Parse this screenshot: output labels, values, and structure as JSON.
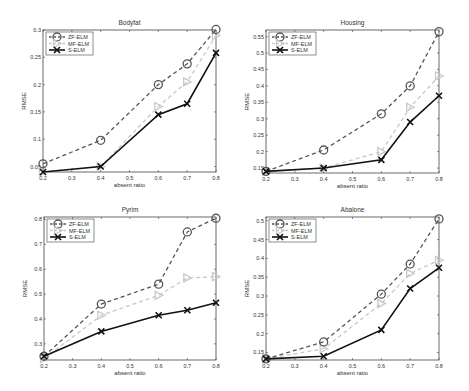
{
  "chart_data": [
    {
      "type": "line",
      "title": "Bodyfat",
      "xlabel": "absent ratio",
      "ylabel": "RMSE",
      "x": [
        0.2,
        0.4,
        0.6,
        0.7,
        0.8
      ],
      "xticks": [
        "0.2",
        "0.3",
        "0.4",
        "0.5",
        "0.6",
        "0.7",
        "0.8"
      ],
      "yticks": [
        "0.05",
        "0.1",
        "0.15",
        "0.2",
        "0.25",
        "0.3"
      ],
      "ylim": [
        0.04,
        0.3
      ],
      "xlim": [
        0.2,
        0.8
      ],
      "legend_position": "upper left",
      "grid": false,
      "series": [
        {
          "name": "ZF-ELM",
          "values": [
            0.055,
            0.098,
            0.2,
            0.238,
            0.301
          ]
        },
        {
          "name": "MF-ELM",
          "values": [
            0.04,
            0.05,
            0.16,
            0.205,
            0.29
          ]
        },
        {
          "name": "S-ELM",
          "values": [
            0.04,
            0.05,
            0.145,
            0.165,
            0.258
          ]
        }
      ]
    },
    {
      "type": "line",
      "title": "Housing",
      "xlabel": "absent ratio",
      "ylabel": "RMSE",
      "x": [
        0.2,
        0.4,
        0.6,
        0.7,
        0.8
      ],
      "xticks": [
        "0.2",
        "0.3",
        "0.4",
        "0.5",
        "0.6",
        "0.7",
        "0.8"
      ],
      "yticks": [
        "0.15",
        "0.2",
        "0.25",
        "0.3",
        "0.35",
        "0.4",
        "0.45",
        "0.5",
        "0.55"
      ],
      "ylim": [
        0.135,
        0.57
      ],
      "xlim": [
        0.2,
        0.8
      ],
      "legend_position": "upper left",
      "grid": false,
      "series": [
        {
          "name": "ZF-ELM",
          "values": [
            0.14,
            0.205,
            0.315,
            0.4,
            0.565
          ]
        },
        {
          "name": "MF-ELM",
          "values": [
            0.14,
            0.15,
            0.2,
            0.335,
            0.43
          ]
        },
        {
          "name": "S-ELM",
          "values": [
            0.14,
            0.15,
            0.175,
            0.29,
            0.37
          ]
        }
      ]
    },
    {
      "type": "line",
      "title": "Pyrim",
      "xlabel": "absent ratio",
      "ylabel": "RMSE",
      "x": [
        0.2,
        0.4,
        0.6,
        0.7,
        0.8
      ],
      "xticks": [
        "0.2",
        "0.3",
        "0.4",
        "0.5",
        "0.6",
        "0.7",
        "0.8"
      ],
      "yticks": [
        "0.3",
        "0.4",
        "0.5",
        "0.6",
        "0.7",
        "0.8"
      ],
      "ylim": [
        0.235,
        0.81
      ],
      "xlim": [
        0.2,
        0.8
      ],
      "legend_position": "upper left",
      "grid": false,
      "series": [
        {
          "name": "ZF-ELM",
          "values": [
            0.25,
            0.46,
            0.54,
            0.75,
            0.805
          ]
        },
        {
          "name": "MF-ELM",
          "values": [
            0.24,
            0.415,
            0.495,
            0.565,
            0.57
          ]
        },
        {
          "name": "S-ELM",
          "values": [
            0.25,
            0.35,
            0.415,
            0.435,
            0.465
          ]
        }
      ]
    },
    {
      "type": "line",
      "title": "Abalone",
      "xlabel": "absent ratio",
      "ylabel": "RMSE",
      "x": [
        0.2,
        0.4,
        0.6,
        0.7,
        0.8
      ],
      "xticks": [
        "0.2",
        "0.3",
        "0.4",
        "0.5",
        "0.6",
        "0.7",
        "0.8"
      ],
      "yticks": [
        "0.15",
        "0.2",
        "0.25",
        "0.3",
        "0.35",
        "0.4",
        "0.45",
        "0.5"
      ],
      "ylim": [
        0.13,
        0.51
      ],
      "xlim": [
        0.2,
        0.8
      ],
      "legend_position": "upper left",
      "grid": false,
      "series": [
        {
          "name": "ZF-ELM",
          "values": [
            0.133,
            0.178,
            0.305,
            0.385,
            0.505
          ]
        },
        {
          "name": "MF-ELM",
          "values": [
            0.133,
            0.16,
            0.28,
            0.36,
            0.395
          ]
        },
        {
          "name": "S-ELM",
          "values": [
            0.133,
            0.14,
            0.21,
            0.32,
            0.375
          ]
        }
      ]
    }
  ],
  "styles": {
    "ZF-ELM": {
      "color": "#555555",
      "dash": "4,3",
      "width": 1.3,
      "marker": "circle"
    },
    "MF-ELM": {
      "color": "#c8c8c8",
      "dash": "4,3",
      "width": 1.3,
      "marker": "triangle-right"
    },
    "S-ELM": {
      "color": "#111111",
      "dash": "",
      "width": 1.6,
      "marker": "x"
    }
  },
  "layout": [
    {
      "left": 0,
      "top": 0,
      "frame": [
        43,
        30,
        216,
        172
      ]
    },
    {
      "left": 235,
      "top": 0,
      "frame": [
        31,
        30,
        204,
        173
      ]
    },
    {
      "left": 0,
      "top": 195,
      "frame": [
        44,
        22,
        216,
        165
      ]
    },
    {
      "left": 235,
      "top": 195,
      "frame": [
        31,
        22,
        204,
        165
      ]
    }
  ]
}
